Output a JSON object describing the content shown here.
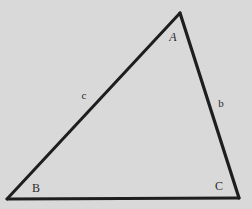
{
  "diagram": {
    "type": "triangle",
    "background": "#d9d9d9",
    "stroke_color": "#1e1e1e",
    "vertices": [
      {
        "name": "A",
        "x": 180,
        "y": 13,
        "label": "A",
        "label_x": 173,
        "label_y": 37,
        "italic": true
      },
      {
        "name": "B",
        "x": 7,
        "y": 199,
        "label": "B",
        "label_x": 36,
        "label_y": 188,
        "italic": false
      },
      {
        "name": "C",
        "x": 239,
        "y": 198,
        "label": "C",
        "label_x": 219,
        "label_y": 186,
        "italic": false
      }
    ],
    "sides": [
      {
        "name": "c",
        "from": "B",
        "to": "A",
        "label": "c",
        "label_x": 84,
        "label_y": 95
      },
      {
        "name": "b",
        "from": "A",
        "to": "C",
        "label": "b",
        "label_x": 221,
        "label_y": 103
      },
      {
        "name": "a",
        "from": "B",
        "to": "C",
        "label": "",
        "label_x": null,
        "label_y": null
      }
    ]
  }
}
